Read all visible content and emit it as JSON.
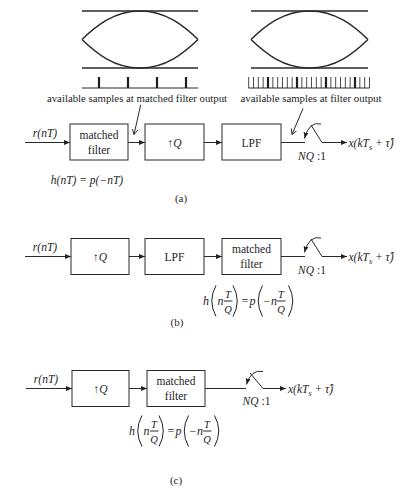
{
  "eye_diagrams": [
    {
      "annotation": "available samples at matched filter output",
      "sample_markers": 4,
      "fine_markers": 0
    },
    {
      "annotation": "available samples at filter output",
      "sample_markers": 4,
      "fine_markers": 26
    }
  ],
  "diagram_a": {
    "caption": "(a)",
    "input": "r(nT)",
    "blocks": [
      {
        "line1": "matched",
        "line2": "filter"
      },
      {
        "arrow": "↑",
        "var": "Q"
      },
      {
        "label": "LPF"
      }
    ],
    "decimator": {
      "factor": "NQ",
      "ratio": " :1"
    },
    "output": {
      "prefix": "x(kT",
      "sub": "s",
      "suffix": " + τ̂)"
    },
    "impulse_response": "h(nT) = p(−nT)"
  },
  "diagram_b": {
    "caption": "(b)",
    "input": "r(nT)",
    "blocks": [
      {
        "arrow": "↑",
        "var": "Q"
      },
      {
        "label": "LPF"
      },
      {
        "line1": "matched",
        "line2": "filter"
      }
    ],
    "decimator": {
      "factor": "NQ",
      "ratio": " :1"
    },
    "output": {
      "prefix": "x(kT",
      "sub": "s",
      "suffix": " + τ̂)"
    },
    "impulse_response": {
      "text": "h(nT/Q) = p(−nT/Q)",
      "lhs_fn": "h",
      "lhs_arg": "n",
      "num": "T",
      "den": "Q",
      "eq": "=",
      "rhs_fn": "p",
      "rhs_minus": "−",
      "rhs_arg": "n"
    }
  },
  "diagram_c": {
    "caption": "(c)",
    "input": "r(nT)",
    "blocks": [
      {
        "arrow": "↑",
        "var": "Q"
      },
      {
        "line1": "matched",
        "line2": "filter"
      }
    ],
    "decimator": {
      "factor": "NQ",
      "ratio": " :1"
    },
    "output": {
      "prefix": "x(kT",
      "sub": "s",
      "suffix": " + τ̂)"
    },
    "impulse_response": {
      "text": "h(nT/Q) = p(−nT/Q)",
      "lhs_fn": "h",
      "lhs_arg": "n",
      "num": "T",
      "den": "Q",
      "eq": "=",
      "rhs_fn": "p",
      "rhs_minus": "−",
      "rhs_arg": "n"
    }
  }
}
